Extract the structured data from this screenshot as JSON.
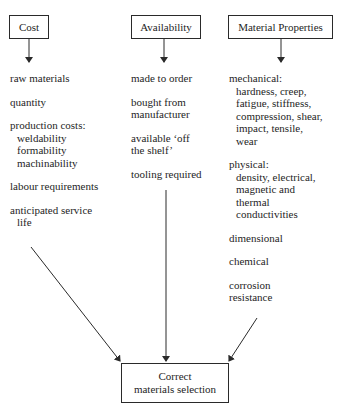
{
  "categories": {
    "cost": {
      "label": "Cost",
      "items": [
        {
          "head": "raw materials",
          "subs": []
        },
        {
          "head": "quantity",
          "subs": []
        },
        {
          "head": "production costs:",
          "subs": [
            "weldability",
            "formability",
            "machinability"
          ]
        },
        {
          "head": "labour requirements",
          "subs": []
        },
        {
          "head": "anticipated service",
          "subs": [
            "life"
          ]
        }
      ]
    },
    "availability": {
      "label": "Availability",
      "items": [
        {
          "head": "made to order",
          "subs": []
        },
        {
          "head": "bought from",
          "subs": []
        },
        {
          "head": "available ‘off",
          "subs": []
        },
        {
          "head": "tooling required",
          "subs": []
        }
      ],
      "continuations": [
        "manufacturer",
        "the shelf’"
      ]
    },
    "properties": {
      "label": "Material Properties",
      "items": [
        {
          "head": "mechanical:",
          "subs": [
            "hardness, creep,",
            "fatigue, stiffness,",
            "compression, shear,",
            "impact, tensile,",
            "wear"
          ]
        },
        {
          "head": "physical:",
          "subs": [
            "density, electrical,",
            "magnetic and",
            "thermal",
            "conductivities"
          ]
        },
        {
          "head": "dimensional",
          "subs": []
        },
        {
          "head": "chemical",
          "subs": []
        },
        {
          "head": "corrosion",
          "subs": []
        }
      ],
      "continuations": [
        "resistance"
      ]
    }
  },
  "result": {
    "line1": "Correct",
    "line2": "materials selection"
  },
  "colors": {
    "line": "#2a2a2a",
    "text": "#1e1e1e",
    "background": "#ffffff"
  }
}
